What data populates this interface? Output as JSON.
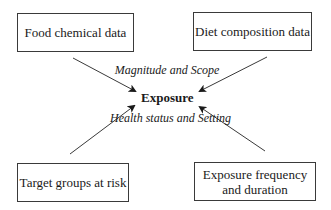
{
  "diagram": {
    "center": {
      "label": "Exposure"
    },
    "boxes": {
      "top_left": {
        "label": "Food chemical data"
      },
      "top_right": {
        "label": "Diet composition data"
      },
      "bottom_left": {
        "label": "Target groups at risk"
      },
      "bottom_right": {
        "label": "Exposure frequency and duration"
      }
    },
    "annotations": {
      "upper": "Magnitude and Scope",
      "lower": "Health status and Setting"
    },
    "edges": [
      {
        "from": "Food chemical data",
        "to": "Exposure"
      },
      {
        "from": "Diet composition data",
        "to": "Exposure"
      },
      {
        "from": "Target groups at risk",
        "to": "Exposure"
      },
      {
        "from": "Exposure frequency and duration",
        "to": "Exposure"
      }
    ],
    "colors": {
      "stroke": "#3a3a3a",
      "text": "#1a1a1a",
      "background": "#ffffff"
    }
  }
}
